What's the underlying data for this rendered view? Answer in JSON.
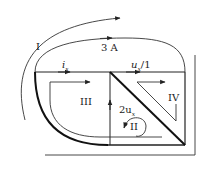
{
  "diagram": {
    "loops": [
      {
        "id": "I",
        "label": "I"
      },
      {
        "id": "II",
        "label": "II"
      },
      {
        "id": "III",
        "label": "III"
      },
      {
        "id": "IV",
        "label": "IV"
      }
    ],
    "branch_labels": {
      "current_source": "3 A",
      "current_ix": "i",
      "current_ix_sub": "x",
      "vccs": "u",
      "vccs_sub": "x",
      "vccs_suffix": "/1",
      "vcvs_prefix": "2u",
      "vcvs_sub": "x"
    },
    "colors": {
      "stroke": "#222222",
      "background": "#ffffff"
    }
  }
}
